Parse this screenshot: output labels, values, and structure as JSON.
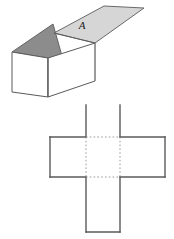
{
  "figure": {
    "background_color": "#ffffff",
    "stroke_color": "#5a5a5a",
    "stroke_color_dark": "#444444",
    "fold_line_color": "#9a9a9a",
    "labels": {
      "flap_a": "A"
    },
    "box": {
      "name": "open-box-3d",
      "face_fill_front": "#ffffff",
      "face_fill_side": "#ffffff",
      "flap_open_fill": "#d6d6d6",
      "flap_inner_fill": "#8c8c8c",
      "flap_label": "A",
      "description": "Open cube with one lid flap raised and labelled A"
    },
    "net": {
      "name": "cross-net",
      "square_count": 5,
      "arrangement": "plus",
      "face_fill": "#ffffff",
      "outline_style": "solid",
      "fold_line_style": "dotted",
      "fold_edges": 4
    }
  }
}
